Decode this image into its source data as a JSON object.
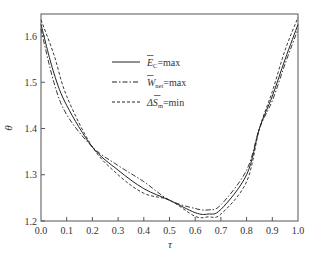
{
  "chart_data": {
    "type": "line",
    "title": "",
    "xlabel": "τ",
    "ylabel": "θ",
    "xlim": [
      0.0,
      1.0
    ],
    "ylim": [
      1.2,
      1.65
    ],
    "grid": false,
    "legend_position": "upper center",
    "x_ticks": [
      "0.0",
      "0.1",
      "0.2",
      "0.3",
      "0.4",
      "0.5",
      "0.6",
      "0.7",
      "0.8",
      "0.9",
      "1.0"
    ],
    "y_ticks": [
      "1.2",
      "1.3",
      "1.4",
      "1.5",
      "1.6"
    ],
    "x": [
      0.0,
      0.05,
      0.1,
      0.2,
      0.3,
      0.4,
      0.5,
      0.6,
      0.65,
      0.7,
      0.8,
      0.85,
      0.9,
      0.95,
      1.0
    ],
    "series": [
      {
        "name": "Ē_C=max",
        "style": "solid",
        "values": [
          1.625,
          1.52,
          1.45,
          1.36,
          1.31,
          1.27,
          1.245,
          1.218,
          1.215,
          1.225,
          1.3,
          1.4,
          1.47,
          1.55,
          1.625
        ]
      },
      {
        "name": "W̄_net=max",
        "style": "dashdot",
        "values": [
          1.615,
          1.5,
          1.43,
          1.36,
          1.32,
          1.285,
          1.245,
          1.227,
          1.224,
          1.235,
          1.31,
          1.4,
          1.46,
          1.54,
          1.615
        ]
      },
      {
        "name": "ΔS̄_m=min",
        "style": "dashed",
        "values": [
          1.635,
          1.56,
          1.47,
          1.36,
          1.3,
          1.26,
          1.245,
          1.21,
          1.209,
          1.215,
          1.285,
          1.4,
          1.48,
          1.57,
          1.64
        ]
      }
    ]
  },
  "legend": {
    "items": [
      {
        "main": "E",
        "sub": "C",
        "rest": "=max"
      },
      {
        "main": "W",
        "sub": "net",
        "rest": "=max"
      },
      {
        "main": "ΔS",
        "sub": "m",
        "rest": "=min"
      }
    ]
  },
  "axes": {
    "xlabel": "τ",
    "ylabel": "θ"
  }
}
